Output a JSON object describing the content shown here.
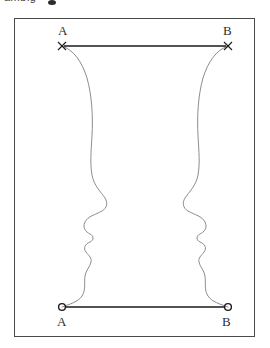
{
  "figure": {
    "title_fragment": "ambig",
    "frame": {
      "x": 14,
      "y": 18,
      "width": 241,
      "height": 319,
      "border_color": "#4a4a4a"
    },
    "background_color": "#ffffff",
    "contour_color": "#8c8c8c",
    "chord_color": "#1a1a1a",
    "marker_color": "#1a1a1a"
  },
  "endpoints": {
    "top_left": {
      "label": "A",
      "marker": "x-marker",
      "x": 62,
      "y": 46
    },
    "top_right": {
      "label": "B",
      "marker": "x-marker",
      "x": 228,
      "y": 46
    },
    "bottom_left": {
      "label": "A",
      "marker": "circle-marker",
      "x": 62,
      "y": 307
    },
    "bottom_right": {
      "label": "B",
      "marker": "circle-marker",
      "x": 228,
      "y": 307
    }
  },
  "chords": [
    {
      "name": "top-chord",
      "from": "A",
      "to": "B",
      "y": 46
    },
    {
      "name": "bottom-chord",
      "from": "A",
      "to": "B",
      "y": 307
    }
  ],
  "illusion": {
    "kind": "rubin-vase-two-faces",
    "left_profile_name": "left-face-profile",
    "right_profile_name": "right-face-profile",
    "narrowest_gap_y": 205,
    "left_nose_tip_x": 105,
    "right_nose_tip_x": 185
  }
}
